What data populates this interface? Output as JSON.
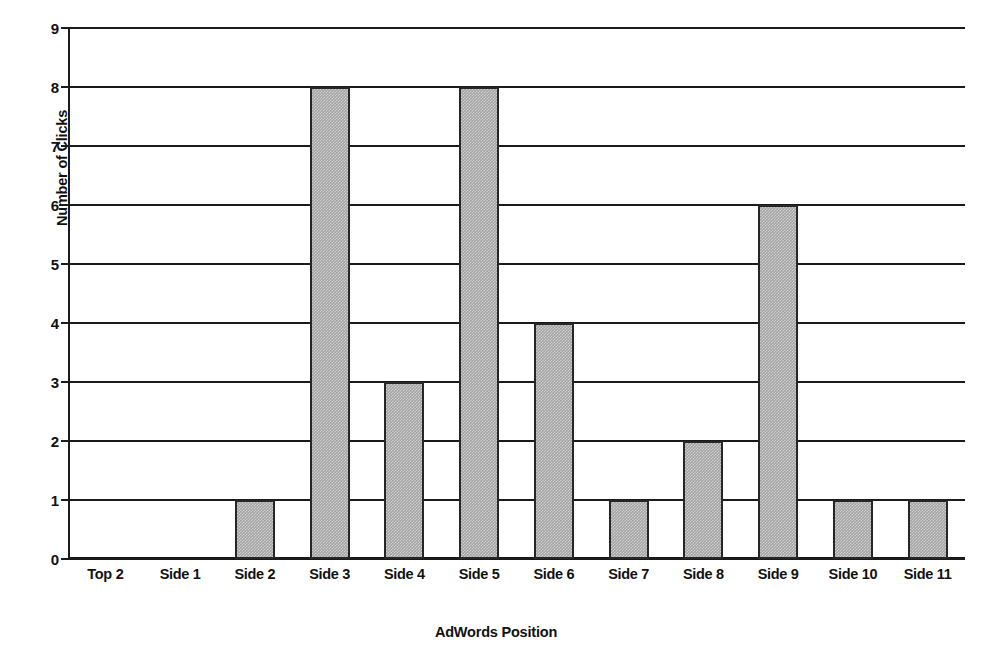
{
  "chart_data": {
    "type": "bar",
    "title": "",
    "subtitle": "",
    "xlabel": "AdWords Position",
    "ylabel": "Number of Clicks",
    "categories": [
      "Top 2",
      "Side 1",
      "Side 2",
      "Side 3",
      "Side 4",
      "Side 5",
      "Side 6",
      "Side 7",
      "Side 8",
      "Side 9",
      "Side 10",
      "Side 11"
    ],
    "values": [
      0,
      0,
      1,
      8,
      3,
      8,
      4,
      1,
      2,
      6,
      1,
      1
    ],
    "ylim": [
      0,
      9
    ],
    "y_ticks": [
      0,
      1,
      2,
      3,
      4,
      5,
      6,
      7,
      8,
      9
    ],
    "y_tick_labels": [
      "0",
      "1",
      "2",
      "3",
      "4",
      "5",
      "6",
      "7",
      "8",
      "9"
    ],
    "grid": "horizontal",
    "legend": "none",
    "bar_fill_color": "#a3a3a3",
    "bar_border_color": "#262626",
    "axis_color": "#1b1b1b",
    "background_color": "#ffffff",
    "annotations": []
  }
}
